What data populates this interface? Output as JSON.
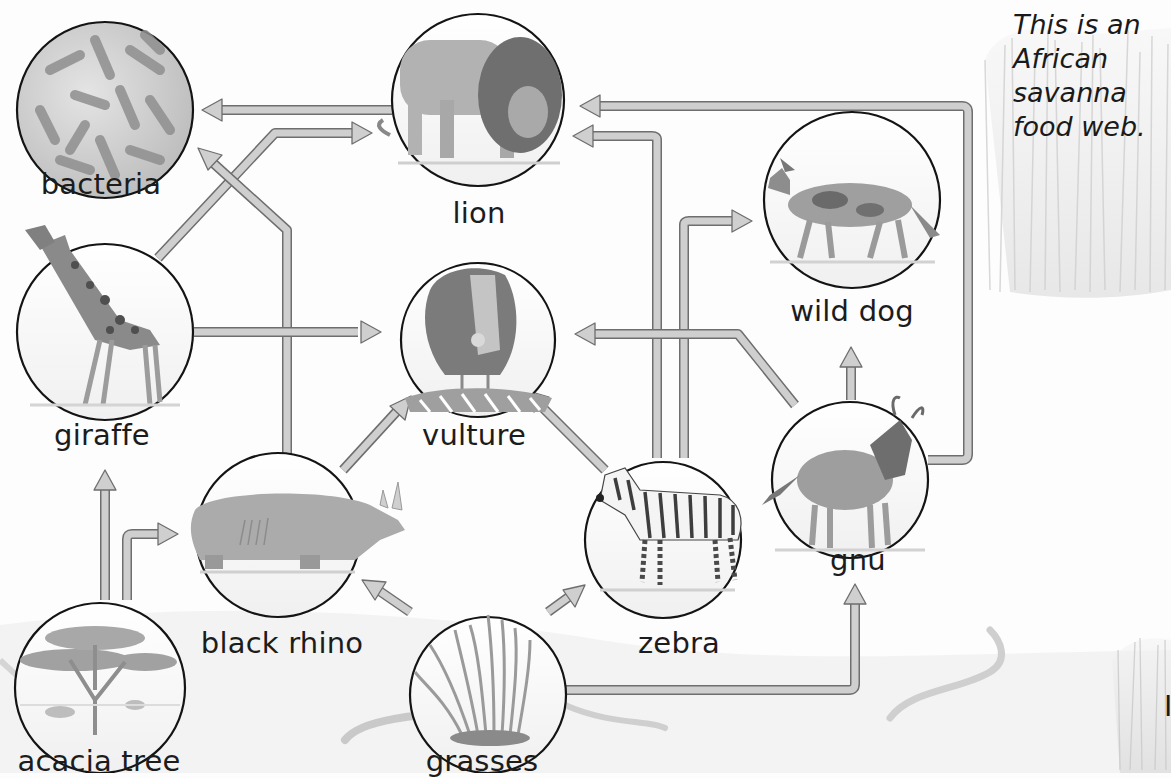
{
  "caption": {
    "lines": [
      "This is an",
      "African",
      "savanna",
      "food web."
    ]
  },
  "partial_text": "I",
  "nodes": [
    {
      "id": "bacteria",
      "label": "bacteria",
      "icon": "bacteria-icon"
    },
    {
      "id": "lion",
      "label": "lion",
      "icon": "lion-icon"
    },
    {
      "id": "wild_dog",
      "label": "wild dog",
      "icon": "wild-dog-icon"
    },
    {
      "id": "giraffe",
      "label": "giraffe",
      "icon": "giraffe-icon"
    },
    {
      "id": "vulture",
      "label": "vulture",
      "icon": "vulture-icon"
    },
    {
      "id": "gnu",
      "label": "gnu",
      "icon": "gnu-icon"
    },
    {
      "id": "black_rhino",
      "label": "black rhino",
      "icon": "rhino-icon"
    },
    {
      "id": "zebra",
      "label": "zebra",
      "icon": "zebra-icon"
    },
    {
      "id": "acacia_tree",
      "label": "acacia tree",
      "icon": "acacia-tree-icon"
    },
    {
      "id": "grasses",
      "label": "grasses",
      "icon": "grass-icon"
    }
  ],
  "edges": [
    {
      "from": "lion",
      "to": "bacteria"
    },
    {
      "from": "black_rhino",
      "to": "bacteria"
    },
    {
      "from": "giraffe",
      "to": "lion"
    },
    {
      "from": "zebra",
      "to": "lion"
    },
    {
      "from": "gnu",
      "to": "lion"
    },
    {
      "from": "zebra",
      "to": "wild_dog"
    },
    {
      "from": "gnu",
      "to": "wild_dog"
    },
    {
      "from": "giraffe",
      "to": "vulture"
    },
    {
      "from": "black_rhino",
      "to": "vulture"
    },
    {
      "from": "zebra",
      "to": "vulture"
    },
    {
      "from": "gnu",
      "to": "vulture"
    },
    {
      "from": "acacia_tree",
      "to": "giraffe"
    },
    {
      "from": "acacia_tree",
      "to": "black_rhino"
    },
    {
      "from": "grasses",
      "to": "black_rhino"
    },
    {
      "from": "grasses",
      "to": "zebra"
    },
    {
      "from": "grasses",
      "to": "gnu"
    }
  ],
  "colors": {
    "arrow_fill": "#cfcfcf",
    "arrow_stroke": "#6e6e6e",
    "circle_stroke": "#141414",
    "ground": "#ececec"
  }
}
